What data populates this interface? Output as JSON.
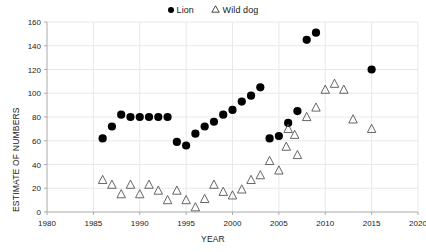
{
  "chart_data": {
    "type": "scatter",
    "title": "",
    "xlabel": "YEAR",
    "ylabel": "ESTIMATE OF NUMBERS",
    "xlim": [
      1980,
      2020
    ],
    "ylim": [
      0,
      160
    ],
    "xticks": [
      1980,
      1985,
      1990,
      1995,
      2000,
      2005,
      2010,
      2015,
      2020
    ],
    "yticks": [
      0,
      20,
      40,
      60,
      80,
      100,
      120,
      140,
      160
    ],
    "grid": true,
    "legend_position": "top-center",
    "series": [
      {
        "name": "Lion",
        "marker": "filled-circle",
        "color": "#000000",
        "points": [
          [
            1986,
            62
          ],
          [
            1987,
            72
          ],
          [
            1988,
            82
          ],
          [
            1989,
            80
          ],
          [
            1990,
            80
          ],
          [
            1991,
            80
          ],
          [
            1992,
            80
          ],
          [
            1993,
            80
          ],
          [
            1994,
            59
          ],
          [
            1995,
            56
          ],
          [
            1996,
            66
          ],
          [
            1997,
            72
          ],
          [
            1998,
            76
          ],
          [
            1999,
            82
          ],
          [
            2000,
            86
          ],
          [
            2001,
            93
          ],
          [
            2002,
            98
          ],
          [
            2003,
            105
          ],
          [
            2004,
            62
          ],
          [
            2005,
            64
          ],
          [
            2006,
            75
          ],
          [
            2007,
            85
          ],
          [
            2008,
            145
          ],
          [
            2009,
            151
          ],
          [
            2015,
            120
          ]
        ]
      },
      {
        "name": "Wild dog",
        "marker": "open-triangle",
        "color": "#555555",
        "points": [
          [
            1986,
            27
          ],
          [
            1987,
            23
          ],
          [
            1988,
            15
          ],
          [
            1989,
            23
          ],
          [
            1990,
            15
          ],
          [
            1991,
            23
          ],
          [
            1992,
            18
          ],
          [
            1993,
            10
          ],
          [
            1994,
            18
          ],
          [
            1995,
            10
          ],
          [
            1996,
            4
          ],
          [
            1997,
            11
          ],
          [
            1998,
            23
          ],
          [
            1999,
            17
          ],
          [
            2000,
            14
          ],
          [
            2001,
            19
          ],
          [
            2002,
            27
          ],
          [
            2003,
            31
          ],
          [
            2004,
            43
          ],
          [
            2005,
            35
          ],
          [
            2005.8,
            55
          ],
          [
            2006,
            70
          ],
          [
            2006.7,
            65
          ],
          [
            2007,
            48
          ],
          [
            2008,
            80
          ],
          [
            2009,
            88
          ],
          [
            2010,
            103
          ],
          [
            2011,
            108
          ],
          [
            2012,
            103
          ],
          [
            2013,
            78
          ],
          [
            2015,
            70
          ]
        ]
      }
    ]
  },
  "legend": {
    "entries": [
      {
        "label": "Lion",
        "marker": "filled-circle"
      },
      {
        "label": "Wild dog",
        "marker": "open-triangle"
      }
    ]
  }
}
